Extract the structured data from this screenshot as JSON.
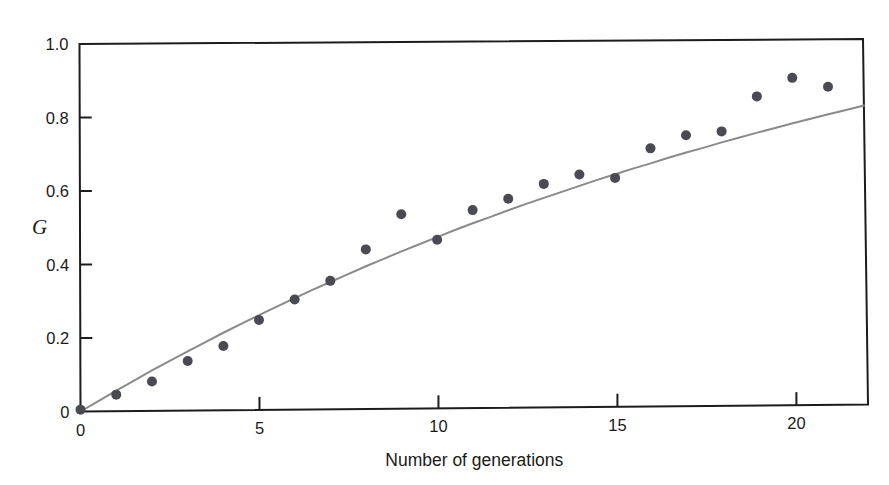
{
  "figure": {
    "background_color": "#ffffff",
    "axis_color": "#1c1c1c",
    "point_color": "#4a4a52",
    "curve_color": "#8a8a8a"
  },
  "axes": {
    "y_title": "G",
    "x_title": "Number of generations",
    "y_ticks": [
      "0",
      "0.2",
      "0.4",
      "0.6",
      "0.8",
      "1.0"
    ],
    "x_ticks": [
      "0",
      "5",
      "10",
      "15",
      "20"
    ]
  },
  "chart_data": {
    "type": "scatter",
    "title": "",
    "xlabel": "Number of generations",
    "ylabel": "G",
    "xlim": [
      0,
      22
    ],
    "ylim": [
      0,
      1.0
    ],
    "xticks": [
      0,
      5,
      10,
      15,
      20
    ],
    "yticks": [
      0,
      0.2,
      0.4,
      0.6,
      0.8,
      1.0
    ],
    "grid": false,
    "legend": "none",
    "series": [
      {
        "name": "Observed G",
        "kind": "scatter",
        "marker": "filled-circle",
        "color": "#4a4a52",
        "x": [
          0,
          1,
          2,
          3,
          4,
          5,
          6,
          7,
          8,
          9,
          10,
          11,
          12,
          13,
          14,
          15,
          16,
          17,
          18,
          19,
          20,
          21
        ],
        "y": [
          0.005,
          0.045,
          0.08,
          0.135,
          0.175,
          0.245,
          0.3,
          0.35,
          0.435,
          0.53,
          0.46,
          0.54,
          0.57,
          0.61,
          0.635,
          0.625,
          0.705,
          0.74,
          0.75,
          0.845,
          0.895,
          0.87
        ]
      },
      {
        "name": "Fitted curve",
        "kind": "line",
        "color": "#8a8a8a",
        "x": [
          0,
          0.5,
          1,
          1.5,
          2,
          2.5,
          3,
          3.5,
          4,
          4.5,
          5,
          5.5,
          6,
          6.5,
          7,
          7.5,
          8,
          8.5,
          9,
          9.5,
          10,
          10.5,
          11,
          11.5,
          12,
          12.5,
          13,
          13.5,
          14,
          14.5,
          15,
          15.5,
          16,
          16.5,
          17,
          17.5,
          18,
          18.5,
          19,
          19.5,
          20,
          20.5,
          21,
          21.5,
          22
        ],
        "y": [
          0.0,
          0.028,
          0.056,
          0.083,
          0.11,
          0.136,
          0.161,
          0.186,
          0.211,
          0.235,
          0.258,
          0.281,
          0.304,
          0.326,
          0.347,
          0.368,
          0.389,
          0.409,
          0.429,
          0.448,
          0.467,
          0.486,
          0.504,
          0.521,
          0.539,
          0.556,
          0.572,
          0.588,
          0.604,
          0.62,
          0.635,
          0.65,
          0.664,
          0.679,
          0.693,
          0.706,
          0.72,
          0.733,
          0.746,
          0.758,
          0.771,
          0.783,
          0.795,
          0.806,
          0.818
        ]
      }
    ]
  }
}
